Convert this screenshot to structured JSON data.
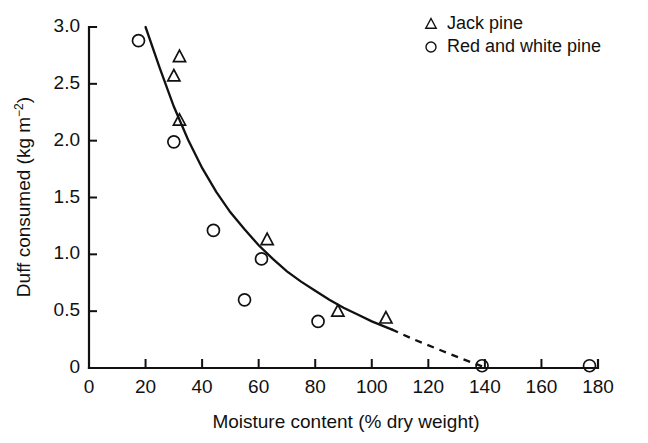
{
  "chart_data": {
    "type": "scatter",
    "title": "",
    "xlabel": "Moisture content (% dry weight)",
    "ylabel": "Duff consumed (kg m−2)",
    "ylabel_main": "Duff consumed (kg m",
    "ylabel_sup": "−2",
    "ylabel_tail": ")",
    "xlim": [
      0,
      180
    ],
    "ylim": [
      0,
      3.0
    ],
    "grid": false,
    "xticks": [
      0,
      20,
      40,
      60,
      80,
      100,
      120,
      140,
      160,
      180
    ],
    "xtick_labels": [
      "0",
      "20",
      "40",
      "60",
      "80",
      "100",
      "120",
      "140",
      "160",
      "180"
    ],
    "yticks": [
      0,
      0.5,
      1.0,
      1.5,
      2.0,
      2.5,
      3.0
    ],
    "ytick_labels": [
      "0",
      "0.5",
      "1.0",
      "1.5",
      "2.0",
      "2.5",
      "3.0"
    ],
    "legend_position": "top-right",
    "series": [
      {
        "name": "Jack pine",
        "marker": "triangle",
        "points": [
          {
            "x": 32,
            "y": 2.74
          },
          {
            "x": 30,
            "y": 2.57
          },
          {
            "x": 32,
            "y": 2.18
          },
          {
            "x": 63,
            "y": 1.13
          },
          {
            "x": 88,
            "y": 0.5
          },
          {
            "x": 105,
            "y": 0.44
          }
        ]
      },
      {
        "name": "Red and white pine",
        "marker": "circle",
        "points": [
          {
            "x": 17.5,
            "y": 2.88
          },
          {
            "x": 30,
            "y": 1.99
          },
          {
            "x": 44,
            "y": 1.21
          },
          {
            "x": 55,
            "y": 0.6
          },
          {
            "x": 61,
            "y": 0.96
          },
          {
            "x": 81,
            "y": 0.41
          },
          {
            "x": 139,
            "y": 0.02
          },
          {
            "x": 177,
            "y": 0.02
          }
        ]
      }
    ],
    "fit_curve": {
      "name": "fitted exponential decay",
      "style_solid_range": [
        20,
        107
      ],
      "style_dashed_range": [
        107,
        139
      ],
      "points": [
        {
          "x": 20,
          "y": 3.0
        },
        {
          "x": 25,
          "y": 2.64
        },
        {
          "x": 30,
          "y": 2.3
        },
        {
          "x": 35,
          "y": 2.01
        },
        {
          "x": 40,
          "y": 1.76
        },
        {
          "x": 45,
          "y": 1.55
        },
        {
          "x": 50,
          "y": 1.37
        },
        {
          "x": 55,
          "y": 1.22
        },
        {
          "x": 60,
          "y": 1.08
        },
        {
          "x": 65,
          "y": 0.96
        },
        {
          "x": 70,
          "y": 0.85
        },
        {
          "x": 75,
          "y": 0.76
        },
        {
          "x": 80,
          "y": 0.68
        },
        {
          "x": 85,
          "y": 0.6
        },
        {
          "x": 90,
          "y": 0.53
        },
        {
          "x": 95,
          "y": 0.47
        },
        {
          "x": 100,
          "y": 0.41
        },
        {
          "x": 105,
          "y": 0.36
        },
        {
          "x": 107,
          "y": 0.34
        },
        {
          "x": 115,
          "y": 0.25
        },
        {
          "x": 125,
          "y": 0.15
        },
        {
          "x": 132,
          "y": 0.08
        },
        {
          "x": 139,
          "y": 0.015
        }
      ]
    },
    "legend": [
      {
        "label": "Jack pine",
        "marker": "triangle"
      },
      {
        "label": "Red and white pine",
        "marker": "circle"
      }
    ]
  }
}
